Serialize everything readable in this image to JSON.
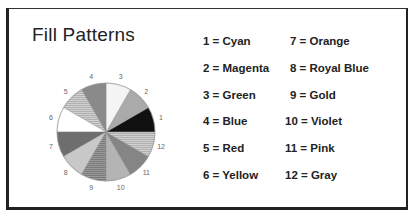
{
  "title": "Fill Patterns",
  "legend": {
    "col1": [
      {
        "label": "1 = Cyan"
      },
      {
        "label": "2 = Magenta"
      },
      {
        "label": "3 = Green"
      },
      {
        "label": "4 = Blue"
      },
      {
        "label": "5 = Red"
      },
      {
        "label": "6 = Yellow"
      }
    ],
    "col2": [
      {
        "label": "7 = Orange"
      },
      {
        "label": "8 = Royal Blue"
      },
      {
        "label": "9 = Gold"
      },
      {
        "label": "10 = Violet"
      },
      {
        "label": "11 = Pink"
      },
      {
        "label": "12 = Gray"
      }
    ]
  },
  "slice_labels": [
    "1",
    "2",
    "3",
    "4",
    "5",
    "6",
    "7",
    "8",
    "9",
    "10",
    "11",
    "12"
  ],
  "chart_data": {
    "type": "pie",
    "title": "Fill Patterns",
    "categories": [
      "1",
      "2",
      "3",
      "4",
      "5",
      "6",
      "7",
      "8",
      "9",
      "10",
      "11",
      "12"
    ],
    "values": [
      1,
      1,
      1,
      1,
      1,
      1,
      1,
      1,
      1,
      1,
      1,
      1
    ],
    "legend": [
      "1 = Cyan",
      "2 = Magenta",
      "3 = Green",
      "4 = Blue",
      "5 = Red",
      "6 = Yellow",
      "7 = Orange",
      "8 = Royal Blue",
      "9 = Gold",
      "10 = Violet",
      "11 = Pink",
      "12 = Gray"
    ],
    "fills": [
      "#111111",
      "#aaaaaa",
      "#f4f4f4",
      "#8a8a8a",
      "#c4c4c4",
      "#ffffff",
      "#6e6e6e",
      "#c8c8c8",
      "#8e8e8e",
      "#b4b4b4",
      "#858585",
      "#9c9c9c"
    ],
    "legend_position": "right"
  }
}
